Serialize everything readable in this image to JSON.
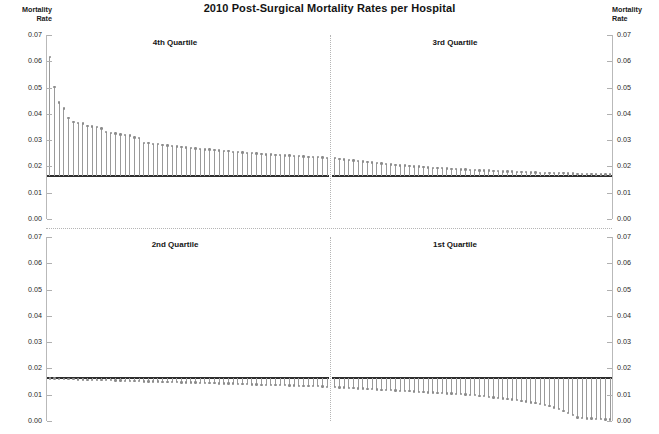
{
  "title": "2010 Post-Surgical Mortality Rates per Hospital",
  "axis_caption_left": "Mortality\nRate",
  "axis_caption_right": "Mortality\nRate",
  "tick_labels": [
    "0.07",
    "0.06",
    "0.05",
    "0.04",
    "0.03",
    "0.02",
    "0.01",
    "0.00"
  ],
  "panels": {
    "q4": "4th Quartile",
    "q3": "3rd Quartile",
    "q2": "2nd Quartile",
    "q1": "1st Quartile"
  },
  "chart_data": {
    "type": "bar",
    "title": "2010 Post-Surgical Mortality Rates per Hospital",
    "xlabel": "",
    "ylabel": "Mortality Rate",
    "ylim": [
      0.0,
      0.07
    ],
    "yticks": [
      0.0,
      0.01,
      0.02,
      0.03,
      0.04,
      0.05,
      0.06,
      0.07
    ],
    "grid": false,
    "legend": "none",
    "baseline": 0.0163,
    "baseline_label": "state average mortality rate reference line",
    "note": "Each vertical stem with a dot marker is one hospital; stems are drawn from the baseline reference line to the hospital mortality rate. Hospitals are sorted descending within each quartile panel.",
    "panels": [
      {
        "name": "4th Quartile",
        "position": "top-left",
        "values": [
          0.0617,
          0.0502,
          0.0443,
          0.0421,
          0.0385,
          0.037,
          0.0366,
          0.0363,
          0.0353,
          0.0352,
          0.0349,
          0.0345,
          0.033,
          0.0327,
          0.0325,
          0.0322,
          0.032,
          0.0318,
          0.031,
          0.0307,
          0.029,
          0.0288,
          0.0286,
          0.0285,
          0.0282,
          0.028,
          0.0278,
          0.0276,
          0.0274,
          0.0272,
          0.027,
          0.0268,
          0.0267,
          0.0265,
          0.0264,
          0.0262,
          0.0261,
          0.0259,
          0.0258,
          0.0256,
          0.0255,
          0.0253,
          0.0252,
          0.025,
          0.0249,
          0.0248,
          0.0246,
          0.0245,
          0.0244,
          0.0243,
          0.0242,
          0.0241,
          0.024,
          0.0239,
          0.0238,
          0.0237,
          0.0236,
          0.0235,
          0.0234,
          0.0233
        ]
      },
      {
        "name": "3rd Quartile",
        "position": "top-right",
        "values": [
          0.0232,
          0.0229,
          0.0227,
          0.0225,
          0.0223,
          0.0221,
          0.0219,
          0.0217,
          0.0215,
          0.0213,
          0.0211,
          0.0209,
          0.0207,
          0.0206,
          0.0204,
          0.0203,
          0.0201,
          0.02,
          0.0199,
          0.0198,
          0.0196,
          0.0195,
          0.0194,
          0.0193,
          0.0192,
          0.0191,
          0.019,
          0.0189,
          0.0188,
          0.0187,
          0.0186,
          0.0185,
          0.0184,
          0.0184,
          0.0183,
          0.0182,
          0.0181,
          0.0181,
          0.018,
          0.0179,
          0.0179,
          0.0178,
          0.0177,
          0.0177,
          0.0176,
          0.0176,
          0.0175,
          0.0175,
          0.0174,
          0.0174,
          0.0173,
          0.0173,
          0.0172,
          0.0172,
          0.0171,
          0.0171,
          0.017,
          0.017,
          0.0169,
          0.0169
        ]
      },
      {
        "name": "2nd Quartile",
        "position": "bottom-left",
        "values": [
          0.0162,
          0.0161,
          0.016,
          0.016,
          0.0159,
          0.0159,
          0.0158,
          0.0158,
          0.0157,
          0.0157,
          0.0156,
          0.0156,
          0.0155,
          0.0155,
          0.0154,
          0.0154,
          0.0153,
          0.0153,
          0.0152,
          0.0152,
          0.0151,
          0.0151,
          0.015,
          0.015,
          0.0149,
          0.0149,
          0.0148,
          0.0148,
          0.0147,
          0.0147,
          0.0146,
          0.0146,
          0.0145,
          0.0145,
          0.0144,
          0.0144,
          0.0143,
          0.0143,
          0.0142,
          0.0142,
          0.0141,
          0.014,
          0.014,
          0.0139,
          0.0139,
          0.0138,
          0.0138,
          0.0137,
          0.0137,
          0.0136,
          0.0136,
          0.0135,
          0.0135,
          0.0134,
          0.0134,
          0.0133,
          0.0132,
          0.0132,
          0.0131,
          0.013
        ]
      },
      {
        "name": "1st Quartile",
        "position": "bottom-right",
        "values": [
          0.0129,
          0.0128,
          0.0127,
          0.0126,
          0.0125,
          0.0124,
          0.0123,
          0.0122,
          0.0121,
          0.012,
          0.0119,
          0.0118,
          0.0117,
          0.0116,
          0.0115,
          0.0114,
          0.0113,
          0.0112,
          0.0111,
          0.011,
          0.0109,
          0.0108,
          0.0107,
          0.0106,
          0.0105,
          0.0104,
          0.0103,
          0.0102,
          0.0101,
          0.01,
          0.0098,
          0.0096,
          0.0094,
          0.0092,
          0.009,
          0.0088,
          0.0086,
          0.0084,
          0.0082,
          0.008,
          0.0077,
          0.0074,
          0.0071,
          0.0068,
          0.0064,
          0.006,
          0.0056,
          0.0051,
          0.0045,
          0.0038,
          0.003,
          0.0022,
          0.0014,
          0.0011,
          0.001,
          0.0009,
          0.0008,
          0.0007,
          0.0006,
          0.0005
        ]
      }
    ]
  }
}
